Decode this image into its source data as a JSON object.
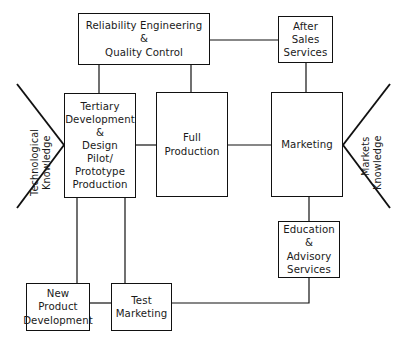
{
  "diagram": {
    "background_color": "#ffffff",
    "line_color": "#111111",
    "text_color": "#1a1a1a",
    "nodes": [
      {
        "id": "reliability-engineering-quality-control",
        "label": "Reliability Engineering\n&\nQuality Control",
        "x": 78,
        "y": 13,
        "w": 132,
        "h": 52,
        "font_size": 10.2
      },
      {
        "id": "after-sales-services",
        "label": "After\nSales\nServices",
        "x": 278,
        "y": 16,
        "w": 55,
        "h": 47,
        "font_size": 10.2
      },
      {
        "id": "tertiary-development-design",
        "label": "Tertiary\nDevelopment\n&\nDesign\nPilot/\nPrototype\nProduction",
        "x": 64,
        "y": 93,
        "w": 72,
        "h": 105,
        "font_size": 10.2
      },
      {
        "id": "full-production",
        "label": "Full\nProduction",
        "x": 156,
        "y": 92,
        "w": 72,
        "h": 105,
        "font_size": 10.2
      },
      {
        "id": "marketing",
        "label": "Marketing",
        "x": 271,
        "y": 92,
        "w": 72,
        "h": 105,
        "font_size": 10.2
      },
      {
        "id": "education-advisory-services",
        "label": "Education\n&\nAdvisory\nServices",
        "x": 278,
        "y": 221,
        "w": 62,
        "h": 57,
        "font_size": 10.2
      },
      {
        "id": "new-product-development",
        "label": "New\nProduct\nDevelopment",
        "x": 26,
        "y": 283,
        "w": 64,
        "h": 48,
        "font_size": 10.2
      },
      {
        "id": "test-marketing",
        "label": "Test\nMarketing",
        "x": 111,
        "y": 283,
        "w": 61,
        "h": 48,
        "font_size": 10.2
      }
    ],
    "funnels": [
      {
        "id": "technological-knowledge",
        "line1": "Technological",
        "line2": "Knowledge",
        "apex_x": 64,
        "apex_y": 145,
        "top_x": 17,
        "top_y": 84,
        "bottom_x": 17,
        "bottom_y": 208,
        "label1_x": 30,
        "label1_y": 196,
        "label2_x": 42,
        "label2_y": 190,
        "font_size": 9.6
      },
      {
        "id": "markets-knowledge",
        "line1": "Markets",
        "line2": "Knowledge",
        "apex_x": 343,
        "apex_y": 145,
        "top_x": 390,
        "top_y": 84,
        "bottom_x": 390,
        "bottom_y": 208,
        "label1_x": 361,
        "label1_y": 176,
        "label2_x": 373,
        "label2_y": 190,
        "font_size": 9.6
      }
    ],
    "connectors": [
      {
        "id": "reliability-to-after-sales",
        "points": "210,40 278,40"
      },
      {
        "id": "reliability-to-tertiary",
        "points": "99,65 99,93"
      },
      {
        "id": "reliability-to-full-production",
        "points": "191,65 191,92"
      },
      {
        "id": "after-sales-to-marketing",
        "points": "306,63 306,92"
      },
      {
        "id": "tertiary-to-full-production",
        "points": "136,145 156,145"
      },
      {
        "id": "full-production-to-marketing",
        "points": "228,145 271,145"
      },
      {
        "id": "marketing-to-education",
        "points": "309,197 309,221"
      },
      {
        "id": "tertiary-to-new-product",
        "points": "77,198 77,303"
      },
      {
        "id": "tertiary-to-test-marketing",
        "points": "125,198 125,283"
      },
      {
        "id": "new-product-to-test-marketing",
        "points": "90,303 111,303"
      },
      {
        "id": "test-marketing-to-education",
        "points": "172,303 309,303 309,278"
      }
    ]
  }
}
